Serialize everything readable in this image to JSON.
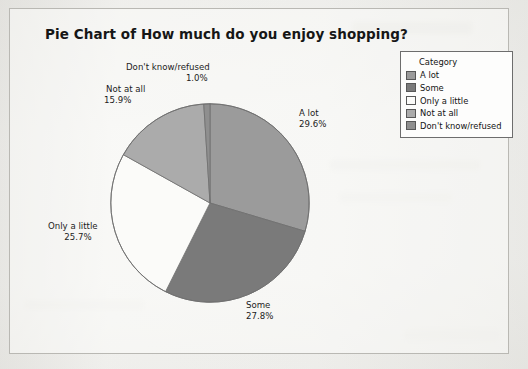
{
  "chart_data": {
    "type": "pie",
    "title": "Pie Chart of How much do you enjoy shopping?",
    "categories": [
      "A lot",
      "Some",
      "Only a little",
      "Not at all",
      "Don't know/refused"
    ],
    "values": [
      29.6,
      27.8,
      25.7,
      15.9,
      1.0
    ],
    "value_labels": [
      "29.6%",
      "27.8%",
      "25.7%",
      "15.9%",
      "1.0%"
    ],
    "units": "percent",
    "start_angle_deg": 0,
    "direction": "clockwise",
    "legend_position": "right",
    "legend_title": "Category",
    "slice_colors": [
      "#9b9b9b",
      "#7a7a7a",
      "#fbfbf9",
      "#ababab",
      "#8f8f8f"
    ],
    "labels_on_slices": true,
    "grid": false,
    "xlabel": "",
    "ylabel": ""
  },
  "chart": {
    "title": "Pie Chart of How much do you enjoy shopping?",
    "slices": [
      {
        "label": "A lot",
        "pct": "29.6%"
      },
      {
        "label": "Some",
        "pct": "27.8%"
      },
      {
        "label": "Only a little",
        "pct": "25.7%"
      },
      {
        "label": "Not at all",
        "pct": "15.9%"
      },
      {
        "label": "Don't know/refused",
        "pct": "1.0%"
      }
    ]
  },
  "legend": {
    "title": "Category",
    "items": [
      {
        "label": "A lot",
        "color": "#9b9b9b"
      },
      {
        "label": "Some",
        "color": "#7a7a7a"
      },
      {
        "label": "Only a little",
        "color": "#fbfbf9"
      },
      {
        "label": "Not at all",
        "color": "#ababab"
      },
      {
        "label": "Don't know/refused",
        "color": "#8f8f8f"
      }
    ]
  }
}
